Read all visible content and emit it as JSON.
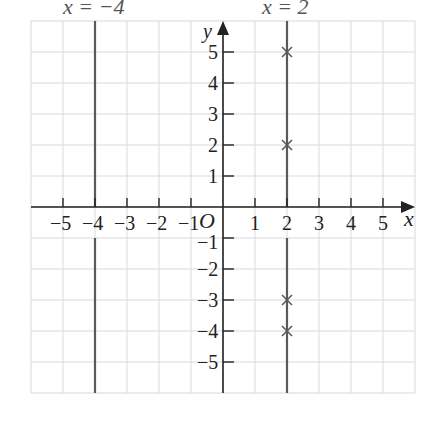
{
  "chart_data": {
    "type": "diagram",
    "title": "",
    "xlabel": "x",
    "ylabel": "y",
    "origin_label": "O",
    "xlim": [
      -6,
      6
    ],
    "ylim": [
      -6,
      6
    ],
    "grid": true,
    "x_ticks": [
      -5,
      -4,
      -3,
      -2,
      -1,
      1,
      2,
      3,
      4,
      5
    ],
    "x_tick_labels": [
      "−5",
      "−4",
      "−3",
      "−2",
      "−1",
      "1",
      "2",
      "3",
      "4",
      "5"
    ],
    "y_ticks": [
      5,
      4,
      3,
      2,
      1,
      -1,
      -2,
      -3,
      -4,
      -5
    ],
    "y_tick_labels": [
      "5",
      "4",
      "3",
      "2",
      "1",
      "−1",
      "−2",
      "−3",
      "−4",
      "−5"
    ],
    "vertical_lines": [
      {
        "x": -4,
        "label": "x = −4"
      },
      {
        "x": 2,
        "label": "x = 2"
      }
    ],
    "marked_points": [
      {
        "x": 2,
        "y": 5
      },
      {
        "x": 2,
        "y": 2
      },
      {
        "x": 2,
        "y": -3
      },
      {
        "x": 2,
        "y": -4
      }
    ]
  },
  "colors": {
    "grid": "#d9d9d9",
    "axis": "#222222",
    "line": "#5a5a5a",
    "marker": "#5a5a5a",
    "label": "#333333"
  },
  "labels": {
    "line_a": "x = −4",
    "line_b": "x = 2",
    "x_axis": "x",
    "y_axis": "y",
    "origin": "O"
  }
}
